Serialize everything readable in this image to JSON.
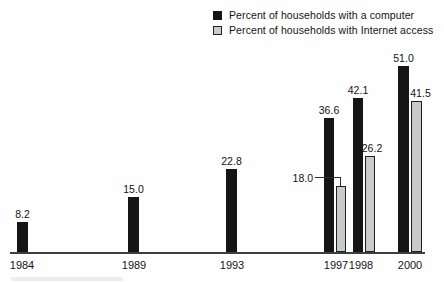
{
  "figure": {
    "background_color": "#fefefe",
    "text_color": "#141414"
  },
  "legend": {
    "position": "top-right",
    "items": [
      {
        "label": "Percent of households with a computer",
        "swatch_color": "#151515",
        "swatch_style": "solid"
      },
      {
        "label": "Percent of households with Internet access",
        "swatch_color": "#c9cbca",
        "swatch_style": "outlined"
      }
    ]
  },
  "chart_data": {
    "type": "bar",
    "categories": [
      "1984",
      "1989",
      "1993",
      "1997",
      "1998",
      "2000"
    ],
    "series": [
      {
        "name": "Percent of households with a computer",
        "color": "#151515",
        "values": [
          8.2,
          15.0,
          22.8,
          36.6,
          42.1,
          51.0
        ]
      },
      {
        "name": "Percent of households with Internet access",
        "color": "#c9cbca",
        "border_color": "#1f1f1f",
        "values": [
          null,
          null,
          null,
          18.0,
          26.2,
          41.5
        ]
      }
    ],
    "value_labels": {
      "computer": [
        "8.2",
        "15.0",
        "22.8",
        "36.6",
        "42.1",
        "51.0"
      ],
      "internet": [
        "18.0",
        "26.2",
        "41.5"
      ]
    },
    "ylim": [
      0,
      55
    ],
    "grid": false,
    "axis_color": "#3d3d3d",
    "legend_position": "top-right",
    "annotations": [
      {
        "text": "18.0",
        "category": "1997",
        "series": "Percent of households with Internet access",
        "style": "leader-line-from-left"
      }
    ]
  }
}
